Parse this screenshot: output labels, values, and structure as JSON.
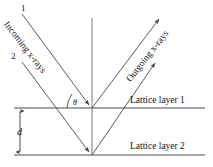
{
  "figure": {
    "name": "bragg-diffraction-diagram",
    "background_color": "#ffffff",
    "line_color": "#4a4a4a",
    "text_color": "#141414"
  },
  "labels": {
    "beam1_number": "1",
    "beam2_number": "2",
    "incoming_rays": "Incoming x-rays",
    "outgoing_rays": "Outgoing x-rays",
    "lattice_layer_1": "Lattice layer 1",
    "lattice_layer_2": "Lattice layer 2",
    "spacing": "d",
    "angle": "θ"
  },
  "geometry": {
    "normal_x": 92,
    "layer1_y": 108,
    "layer2_y": 155,
    "vertex1": {
      "x": 92,
      "y": 108
    },
    "vertex2": {
      "x": 92,
      "y": 155
    },
    "incoming1_start": {
      "x": 22,
      "y": 14
    },
    "incoming2_start": {
      "x": 22,
      "y": 62
    },
    "outgoing1_end": {
      "x": 161,
      "y": 17
    },
    "outgoing2_end": {
      "x": 157,
      "y": 61
    },
    "normal_top": {
      "x": 92,
      "y": 18
    },
    "layer1_x_range": [
      14,
      205
    ],
    "layer2_x_range": [
      14,
      205
    ],
    "d_arrow_x": 20,
    "d_arrow_top": 110,
    "d_arrow_bottom": 153
  }
}
